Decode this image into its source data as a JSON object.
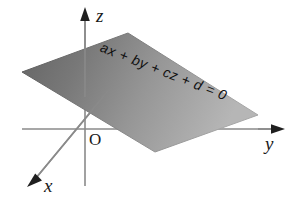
{
  "figure": {
    "type": "diagram",
    "background_color": "#ffffff",
    "width": 294,
    "height": 207
  },
  "axes": {
    "origin_label": "O",
    "origin_point": [
      85,
      129
    ],
    "items": [
      {
        "name": "z",
        "label": "z",
        "direction": "vertical-up",
        "from": [
          85,
          186
        ],
        "to": [
          85,
          14
        ],
        "arrow_at": [
          85,
          11
        ],
        "color": "#8a8a8a"
      },
      {
        "name": "y",
        "label": "y",
        "direction": "horizontal-right",
        "from": [
          22,
          129
        ],
        "to": [
          276,
          129
        ],
        "arrow_at": [
          281,
          129
        ],
        "color": "#8a8a8a"
      },
      {
        "name": "x",
        "label": "x",
        "direction": "diagonal-down-left",
        "from": [
          132,
          62
        ],
        "to": [
          36,
          178
        ],
        "arrow_at": [
          30,
          184
        ],
        "color": "#8a8a8a"
      }
    ]
  },
  "plane": {
    "name": "shaded-plane",
    "shape": "parallelogram",
    "corners": [
      [
        22,
        72
      ],
      [
        128,
        33
      ],
      [
        258,
        115
      ],
      [
        155,
        152
      ]
    ],
    "fill_gradient": {
      "type": "linear",
      "from_color": "#6a6a6a",
      "to_color": "#b0b0b0",
      "direction": "left-to-right"
    },
    "equation": "ax + by + cz + d = 0",
    "equation_rotation_deg": 21.5
  },
  "colors": {
    "background": "#ffffff",
    "axis_line": "#8a8a8a",
    "arrow_head": "#1a1a1a",
    "text": "#1a1a1a",
    "plane_dark": "#6a6a6a",
    "plane_light": "#b0b0b0"
  }
}
